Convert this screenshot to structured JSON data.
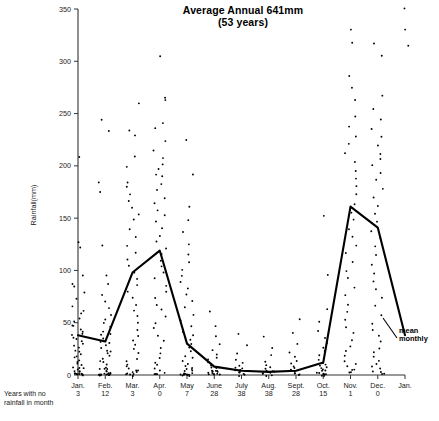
{
  "chart_data": {
    "type": "scatter",
    "title": "Average Annual 641mm",
    "subtitle": "(53 years)",
    "xlabel": "",
    "ylabel": "Rainfall(mm)",
    "ylim": [
      0,
      350
    ],
    "yticks": [
      0,
      50,
      100,
      150,
      200,
      250,
      300,
      350
    ],
    "grid": false,
    "legend_position": "inline-annotation",
    "annotations": [
      {
        "text": "mean monthly",
        "target_series": "mean monthly"
      }
    ],
    "categories": [
      "Jan.",
      "Feb.",
      "Mar.",
      "Apr.",
      "May",
      "June",
      "July",
      "Aug.",
      "Sept.",
      "Oct.",
      "Nov.",
      "Dec.",
      "Jan."
    ],
    "series": [
      {
        "name": "mean monthly",
        "type": "line",
        "categories": [
          "Jan.",
          "Feb.",
          "Mar.",
          "Apr.",
          "May",
          "June",
          "July",
          "Aug.",
          "Sept.",
          "Oct.",
          "Nov.",
          "Dec.",
          "Jan."
        ],
        "values": [
          38,
          32,
          98,
          119,
          30,
          8,
          4,
          3,
          4,
          12,
          161,
          141,
          38
        ]
      }
    ],
    "secondary_axis": {
      "label": "Years with no rainfall in month",
      "categories": [
        "Jan.",
        "Feb.",
        "Mar.",
        "Apr.",
        "May",
        "June",
        "July",
        "Aug.",
        "Sept.",
        "Oct.",
        "Nov.",
        "Dec."
      ],
      "values": [
        3,
        12,
        3,
        0,
        7,
        28,
        38,
        38,
        28,
        15,
        1,
        0
      ]
    },
    "scatter_points": {
      "description": "Individual yearly monthly rainfall totals (mm) per month",
      "Jan.": [
        208,
        128,
        122,
        96,
        88,
        84,
        78,
        72,
        66,
        62,
        58,
        54,
        52,
        48,
        46,
        44,
        42,
        40,
        38,
        36,
        34,
        32,
        30,
        28,
        26,
        24,
        22,
        20,
        18,
        16,
        14,
        12,
        10,
        9,
        8,
        7,
        6,
        5,
        4,
        3,
        2,
        2,
        1,
        1,
        1,
        0,
        0,
        0,
        0,
        0
      ],
      "Feb.": [
        244,
        233,
        184,
        176,
        124,
        96,
        88,
        76,
        70,
        64,
        58,
        54,
        50,
        46,
        42,
        40,
        38,
        34,
        32,
        30,
        28,
        26,
        24,
        22,
        20,
        18,
        16,
        14,
        12,
        10,
        8,
        7,
        6,
        5,
        4,
        3,
        2,
        2,
        1,
        1,
        0,
        0,
        0,
        0,
        0,
        0,
        0,
        0,
        0,
        0
      ],
      "Mar.": [
        259,
        233,
        229,
        208,
        198,
        184,
        181,
        172,
        166,
        160,
        154,
        148,
        140,
        132,
        124,
        116,
        110,
        104,
        98,
        92,
        86,
        80,
        74,
        68,
        62,
        56,
        50,
        44,
        38,
        32,
        28,
        24,
        20,
        16,
        13,
        10,
        8,
        6,
        5,
        4,
        3,
        2,
        1,
        1,
        0,
        0,
        0
      ],
      "Apr.": [
        305,
        266,
        263,
        240,
        236,
        224,
        214,
        208,
        202,
        196,
        192,
        190,
        182,
        176,
        170,
        164,
        158,
        152,
        146,
        140,
        134,
        128,
        122,
        116,
        110,
        104,
        98,
        92,
        86,
        80,
        74,
        68,
        62,
        56,
        50,
        44,
        38,
        32,
        26,
        20,
        16,
        12,
        9,
        7,
        5,
        3,
        2,
        1,
        1,
        0
      ],
      "May": [
        224,
        192,
        160,
        148,
        136,
        124,
        116,
        108,
        100,
        94,
        88,
        82,
        76,
        70,
        64,
        58,
        52,
        46,
        42,
        38,
        34,
        30,
        26,
        22,
        19,
        16,
        13,
        11,
        9,
        7,
        6,
        5,
        4,
        3,
        2,
        2,
        1,
        1,
        0,
        0,
        0,
        0,
        0,
        0,
        0,
        0
      ],
      "June": [
        60,
        46,
        38,
        30,
        24,
        20,
        17,
        14,
        12,
        10,
        8,
        7,
        6,
        5,
        4,
        4,
        3,
        3,
        2,
        2,
        1,
        1,
        1,
        0,
        0
      ],
      "July": [
        40,
        28,
        20,
        15,
        12,
        9,
        7,
        6,
        5,
        4,
        3,
        2,
        2,
        1,
        1,
        0
      ],
      "Aug.": [
        36,
        26,
        18,
        13,
        10,
        8,
        6,
        5,
        4,
        3,
        2,
        1,
        1,
        0,
        0
      ],
      "Sept.": [
        54,
        40,
        30,
        22,
        17,
        13,
        10,
        8,
        6,
        5,
        4,
        3,
        2,
        1,
        1,
        0
      ],
      "Oct.": [
        152,
        96,
        62,
        50,
        42,
        36,
        30,
        26,
        22,
        18,
        15,
        12,
        10,
        8,
        7,
        6,
        5,
        4,
        3,
        2,
        2,
        1,
        1,
        0,
        0,
        0,
        0
      ],
      "Nov.": [
        330,
        318,
        286,
        274,
        262,
        248,
        238,
        228,
        220,
        212,
        204,
        196,
        188,
        180,
        172,
        164,
        156,
        148,
        140,
        132,
        124,
        116,
        108,
        100,
        92,
        84,
        76,
        68,
        60,
        52,
        46,
        40,
        34,
        28,
        22,
        18,
        14,
        10,
        8,
        6,
        4,
        3,
        2
      ],
      "Dec.": [
        318,
        306,
        268,
        254,
        244,
        236,
        228,
        220,
        212,
        206,
        200,
        194,
        186,
        178,
        170,
        162,
        154,
        146,
        138,
        130,
        122,
        114,
        106,
        98,
        90,
        82,
        74,
        66,
        58,
        50,
        44,
        38,
        32,
        26,
        22,
        18,
        14,
        10,
        8,
        6,
        4,
        3,
        2,
        1
      ],
      "Jan.2": [
        350,
        330,
        315
      ]
    }
  },
  "labels": {
    "dry_caption_line1": "Years with no",
    "dry_caption_line2": "rainfall in month",
    "mean_annotation_line1": "mean",
    "mean_annotation_line2": "monthly"
  }
}
